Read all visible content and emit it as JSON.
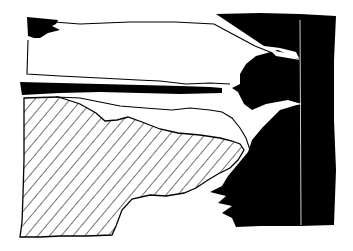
{
  "image": {
    "kind": "abstract black-and-white ink drawing",
    "width": 353,
    "height": 251,
    "colors": {
      "background": "#ffffff",
      "ink": "#000000"
    },
    "regions": [
      {
        "name": "upper-left-black-patch",
        "fill": "solid"
      },
      {
        "name": "upper-white-band",
        "fill": "none"
      },
      {
        "name": "middle-black-stripe",
        "fill": "solid"
      },
      {
        "name": "lower-left-hatched-area",
        "fill": "diagonal-hatch"
      },
      {
        "name": "right-black-mass",
        "fill": "solid"
      }
    ]
  }
}
